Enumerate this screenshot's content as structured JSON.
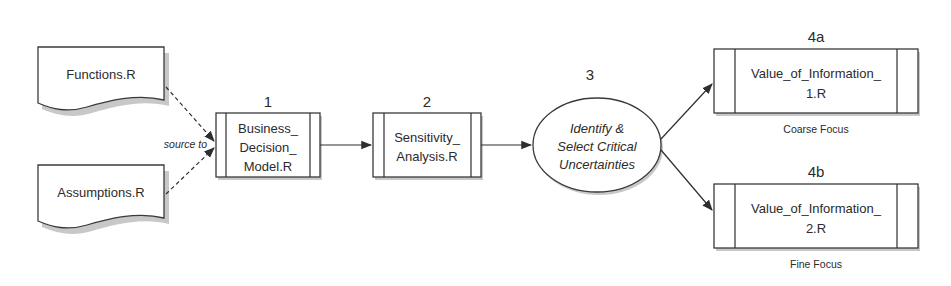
{
  "diagram": {
    "inputs": [
      {
        "id": "functions",
        "label": "Functions.R",
        "shape": "document"
      },
      {
        "id": "assumptions",
        "label": "Assumptions.R",
        "shape": "document"
      }
    ],
    "source_edge_label": "source to",
    "steps": [
      {
        "id": "step1",
        "number": "1",
        "lines": [
          "Business_",
          "Decision_",
          "Model.R"
        ],
        "shape": "predefined-process"
      },
      {
        "id": "step2",
        "number": "2",
        "lines": [
          "Sensitivity_",
          "Analysis.R"
        ],
        "shape": "predefined-process"
      },
      {
        "id": "step3",
        "number": "3",
        "lines": [
          "Identify &",
          "Select Critical",
          "Uncertainties"
        ],
        "shape": "ellipse"
      },
      {
        "id": "step4a",
        "number": "4a",
        "lines": [
          "Value_of_Information_",
          "1.R"
        ],
        "caption": "Coarse Focus",
        "shape": "predefined-process"
      },
      {
        "id": "step4b",
        "number": "4b",
        "lines": [
          "Value_of_Information_",
          "2.R"
        ],
        "caption": "Fine Focus",
        "shape": "predefined-process"
      }
    ],
    "edges": [
      {
        "from": "functions",
        "to": "step1",
        "style": "dashed"
      },
      {
        "from": "assumptions",
        "to": "step1",
        "style": "dashed"
      },
      {
        "from": "step1",
        "to": "step2",
        "style": "solid"
      },
      {
        "from": "step2",
        "to": "step3",
        "style": "solid"
      },
      {
        "from": "step3",
        "to": "step4a",
        "style": "solid"
      },
      {
        "from": "step3",
        "to": "step4b",
        "style": "solid"
      }
    ]
  }
}
